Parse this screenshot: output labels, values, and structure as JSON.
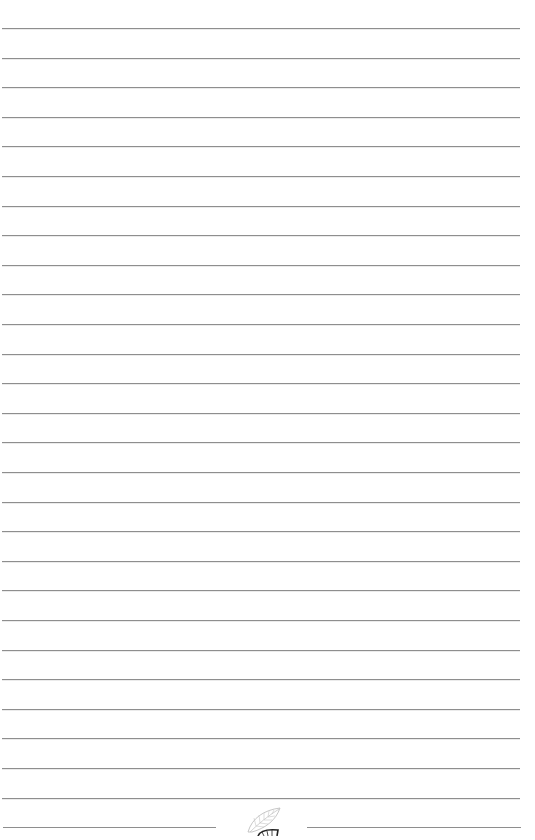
{
  "page": {
    "type": "lined-paper",
    "background": "#ffffff",
    "line_color": "#8e8e8e",
    "line_count": 28,
    "first_line_y": 28,
    "line_spacing": 29.6,
    "line_left": 2,
    "line_right": 520
  },
  "footer": {
    "left_segment": {
      "x1": 3,
      "x2": 216
    },
    "right_segment": {
      "x1": 307,
      "x2": 521
    },
    "ornament": "leaf-icon"
  }
}
